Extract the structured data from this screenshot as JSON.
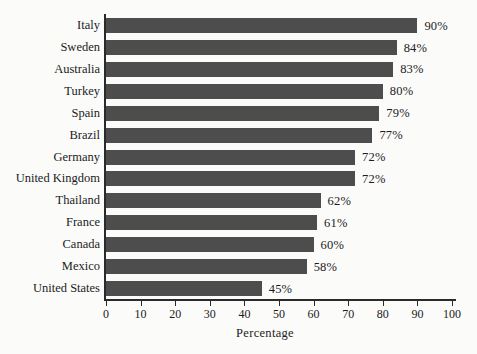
{
  "chart_data": {
    "type": "bar",
    "orientation": "horizontal",
    "title": "",
    "xlabel": "Percentage",
    "ylabel": "",
    "xlim": [
      0,
      100
    ],
    "xticks": [
      0,
      10,
      20,
      30,
      40,
      50,
      60,
      70,
      80,
      90,
      100
    ],
    "grid": false,
    "legend": false,
    "bar_color": "#4d4d4d",
    "background_color": "#fbfbfa",
    "text_color": "#1c1c1c",
    "value_suffix": "%",
    "categories": [
      "Italy",
      "Sweden",
      "Australia",
      "Turkey",
      "Spain",
      "Brazil",
      "Germany",
      "United Kingdom",
      "Thailand",
      "France",
      "Canada",
      "Mexico",
      "United States"
    ],
    "values": [
      90,
      84,
      83,
      80,
      79,
      77,
      72,
      72,
      62,
      61,
      60,
      58,
      45
    ],
    "value_labels": [
      "90%",
      "84%",
      "83%",
      "80%",
      "79%",
      "77%",
      "72%",
      "72%",
      "62%",
      "61%",
      "60%",
      "58%",
      "45%"
    ],
    "xtick_labels": [
      "0",
      "10",
      "20",
      "30",
      "40",
      "50",
      "60",
      "70",
      "80",
      "90",
      "100"
    ]
  }
}
